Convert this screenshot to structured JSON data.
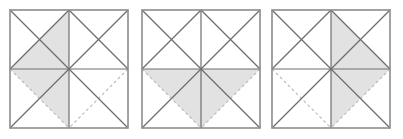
{
  "figure": {
    "title": "Three squares subdivided into eight triangles with shaded regions",
    "type": "geometric-diagram",
    "canvas": {
      "width": 403,
      "height": 139
    },
    "background_color": "#ffffff",
    "style": {
      "border_color": "#8c8c8c",
      "solid_line_color": "#6e6e6e",
      "dashed_line_color": "#bdbdbd",
      "shade_color": "#e2e2e2",
      "line_width": 1.2,
      "border_width": 1.6,
      "dash_pattern": "3,2.6"
    },
    "geometry": {
      "square_size": 118,
      "square_tops": 10,
      "square_lefts": [
        10,
        142,
        272
      ],
      "note": "Each square is split by a horizontal and vertical midline into four quadrants; each quadrant carries both of its diagonals, producing eight triangles."
    },
    "squares": [
      {
        "index": 1,
        "label": "square-1",
        "shaded_triangles": [
          "upper-left-quadrant-inner",
          "lower-left-quadrant-upper"
        ],
        "shaded_count": 2,
        "dashed_edges": [
          "lower-left-outer-diagonal",
          "lower-right-outer-diagonal"
        ]
      },
      {
        "index": 2,
        "label": "square-2",
        "shaded_triangles": [
          "lower-left-quadrant-upper",
          "lower-right-quadrant-upper"
        ],
        "shaded_count": 2,
        "dashed_edges": [
          "lower-left-outer-diagonal",
          "lower-right-outer-diagonal"
        ]
      },
      {
        "index": 3,
        "label": "square-3",
        "shaded_triangles": [
          "upper-right-quadrant-inner",
          "lower-right-quadrant-upper"
        ],
        "shaded_count": 2,
        "dashed_edges": [
          "lower-left-outer-diagonal",
          "lower-right-outer-diagonal"
        ]
      }
    ]
  }
}
